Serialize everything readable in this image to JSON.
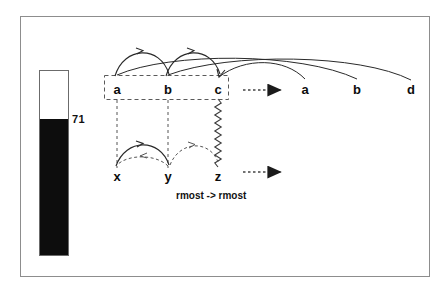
{
  "figure": {
    "gauge": {
      "value_label": "71",
      "filled_fraction": 0.73,
      "fill_color": "#0d0d0d",
      "empty_color": "#ffffff",
      "border_color": "#6b6b6b"
    },
    "frame": {
      "border_color": "#8d8d8d",
      "background": "#ffffff"
    },
    "caption": "rmost -> rmost",
    "top_row": {
      "boxed_nodes": [
        {
          "id": "a",
          "label": "a",
          "x": 117,
          "y": 90
        },
        {
          "id": "b",
          "label": "b",
          "x": 168,
          "y": 90
        },
        {
          "id": "c",
          "label": "c",
          "x": 218,
          "y": 90
        }
      ],
      "target_nodes": [
        {
          "id": "a2",
          "label": "a",
          "x": 305,
          "y": 90
        },
        {
          "id": "b2",
          "label": "b",
          "x": 357,
          "y": 90
        },
        {
          "id": "d2",
          "label": "d",
          "x": 411,
          "y": 90
        }
      ],
      "box_style": "dashed"
    },
    "bottom_row": {
      "nodes": [
        {
          "id": "x",
          "label": "x",
          "x": 117,
          "y": 177
        },
        {
          "id": "y",
          "label": "y",
          "x": 168,
          "y": 177
        },
        {
          "id": "z",
          "label": "z",
          "x": 218,
          "y": 177
        }
      ]
    },
    "edges": [
      {
        "from": "a",
        "to": "b",
        "style": "solid",
        "placement": "above"
      },
      {
        "from": "b",
        "to": "c",
        "style": "solid",
        "placement": "above"
      },
      {
        "from": "a",
        "to": "b2",
        "style": "solid",
        "placement": "above-long"
      },
      {
        "from": "b",
        "to": "d2",
        "style": "solid",
        "placement": "above-long"
      },
      {
        "from": "c",
        "to": "a2",
        "style": "solid",
        "placement": "above-long"
      },
      {
        "from": "x",
        "to": "y",
        "style": "solid",
        "placement": "above"
      },
      {
        "from": "y",
        "to": "x",
        "style": "dashed",
        "placement": "below"
      },
      {
        "from": "y",
        "to": "z",
        "style": "dashed",
        "placement": "above"
      },
      {
        "from": "a",
        "to": "x",
        "style": "dashed",
        "placement": "vertical"
      },
      {
        "from": "b",
        "to": "y",
        "style": "dashed",
        "placement": "vertical"
      },
      {
        "from": "c",
        "to": "z",
        "style": "zigzag",
        "placement": "vertical"
      }
    ],
    "flow_arrows": [
      {
        "id": "top-flow",
        "style": "dotted",
        "x1": 243,
        "x2": 288,
        "y": 90
      },
      {
        "id": "bottom-flow",
        "style": "dotted",
        "x1": 243,
        "x2": 288,
        "y": 172
      }
    ],
    "colors": {
      "ink": "#111111",
      "stroke": "#2a2a2a"
    }
  }
}
